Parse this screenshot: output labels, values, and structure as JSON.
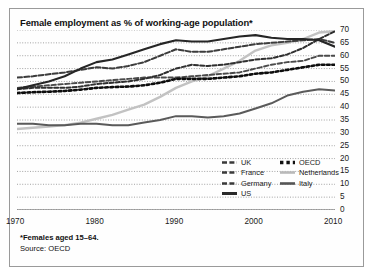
{
  "title": "Female employment as % of working-age population*",
  "footnote": {
    "line1": "*Females aged 15–64.",
    "line2": "Source: OECD"
  },
  "legend": {
    "left": [
      {
        "label": "UK",
        "style": "dashed-dark",
        "color": "#3a3a3a"
      },
      {
        "label": "France",
        "style": "dashed-dark",
        "color": "#3a3a3a"
      },
      {
        "label": "Germany",
        "style": "dashed-dark",
        "color": "#3a3a3a"
      },
      {
        "label": "US",
        "style": "solid-dark",
        "color": "#2a2a2a"
      }
    ],
    "right": [
      {
        "label": "OECD",
        "style": "dotted-bold",
        "color": "#111111"
      },
      {
        "label": "Netherlands",
        "style": "solid-light",
        "color": "#b9b9b9"
      },
      {
        "label": "Italy",
        "style": "solid-mid",
        "color": "#555555"
      }
    ]
  },
  "chart_data": {
    "type": "line",
    "title": "Female employment as % of working-age population*",
    "xlabel": "",
    "ylabel": "",
    "xlim": [
      1970,
      2010
    ],
    "ylim": [
      0,
      70
    ],
    "ytick_step": 5,
    "yticks": [
      0,
      5,
      10,
      15,
      20,
      25,
      30,
      35,
      40,
      45,
      50,
      55,
      60,
      65,
      70
    ],
    "xticks": [
      1970,
      1980,
      1990,
      2000,
      2010
    ],
    "xtick_labels": [
      "1970",
      "1980",
      "1990",
      "2000",
      "2010"
    ],
    "y_axis_side": "right",
    "grid": "horizontal-dotted",
    "legend_position": "inside-bottom-right",
    "note": "*Females aged 15–64.",
    "source": "Source: OECD",
    "x": [
      1970,
      1972,
      1974,
      1976,
      1978,
      1980,
      1982,
      1984,
      1986,
      1988,
      1990,
      1992,
      1994,
      1996,
      1998,
      2000,
      2002,
      2004,
      2006,
      2008,
      2010
    ],
    "series": [
      {
        "name": "UK",
        "values": [
          51.5,
          52.0,
          52.8,
          53.5,
          54.5,
          55.5,
          55.0,
          56.0,
          57.5,
          60.0,
          62.5,
          61.5,
          61.5,
          62.5,
          63.5,
          64.5,
          65.0,
          65.5,
          66.0,
          66.5,
          65.0
        ]
      },
      {
        "name": "France",
        "values": [
          47.5,
          48.0,
          48.5,
          49.0,
          49.5,
          50.0,
          50.5,
          51.0,
          51.5,
          51.5,
          51.5,
          52.0,
          52.5,
          53.0,
          53.5,
          55.0,
          56.5,
          57.5,
          58.0,
          60.0,
          60.0
        ]
      },
      {
        "name": "Germany",
        "values": [
          47.0,
          47.5,
          47.5,
          47.5,
          48.0,
          49.0,
          49.5,
          50.0,
          51.0,
          52.5,
          55.0,
          56.5,
          56.0,
          56.5,
          57.5,
          58.5,
          59.0,
          60.5,
          63.0,
          66.5,
          69.5
        ]
      },
      {
        "name": "US",
        "values": [
          47.0,
          48.5,
          50.0,
          52.0,
          55.0,
          57.5,
          58.5,
          60.5,
          62.5,
          64.5,
          66.0,
          65.5,
          65.5,
          66.5,
          67.5,
          68.0,
          67.0,
          66.5,
          66.5,
          66.0,
          63.5
        ]
      },
      {
        "name": "OECD",
        "values": [
          45.5,
          45.8,
          46.0,
          46.3,
          46.8,
          47.5,
          47.8,
          48.0,
          48.5,
          49.5,
          51.0,
          51.0,
          51.0,
          51.5,
          52.0,
          53.0,
          53.5,
          54.5,
          55.5,
          56.5,
          56.5
        ]
      },
      {
        "name": "Netherlands",
        "values": [
          31.5,
          32.0,
          32.5,
          33.0,
          34.0,
          35.5,
          37.0,
          39.0,
          41.0,
          44.0,
          47.5,
          50.0,
          52.0,
          55.0,
          58.0,
          62.0,
          64.0,
          65.0,
          66.5,
          69.0,
          69.5
        ]
      },
      {
        "name": "Italy",
        "values": [
          33.5,
          33.5,
          33.0,
          33.0,
          33.5,
          33.5,
          33.0,
          33.0,
          34.0,
          35.0,
          36.5,
          36.5,
          36.0,
          36.5,
          37.5,
          39.5,
          41.5,
          44.5,
          46.0,
          47.0,
          46.5
        ]
      }
    ]
  }
}
